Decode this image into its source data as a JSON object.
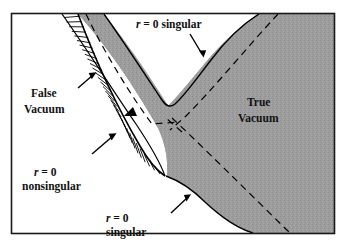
{
  "figure": {
    "frame_color": "#1a1a1a",
    "background_color": "#ffffff",
    "true_vacuum_fill": "#9a9a9a",
    "curve_color": "#000000",
    "dashed_color": "#000000",
    "hatch_color": "#000000"
  },
  "labels": {
    "top_singular": {
      "line1": "r = 0 singular",
      "r_symbol": "r",
      "rest": " = 0 singular"
    },
    "bottom_singular": {
      "line1": "r = 0",
      "line2": "singular"
    },
    "nonsingular": {
      "line1": "r = 0",
      "line2": "nonsingular"
    },
    "false_vacuum": {
      "line1": "False",
      "line2": "Vacuum"
    },
    "true_vacuum": {
      "line1": "True",
      "line2": "Vacuum"
    },
    "r_glyph": "r",
    "eq_zero": " = 0",
    "singular_word": "singular"
  },
  "regions": [
    {
      "name": "false-vacuum-region",
      "label": "False Vacuum"
    },
    {
      "name": "true-vacuum-region",
      "label": "True Vacuum"
    },
    {
      "name": "bubble-wall-band",
      "label": "hatched wall"
    }
  ],
  "annotations": [
    {
      "name": "arrow-top-singular",
      "points_to": "upper singularity curve"
    },
    {
      "name": "arrow-bottom-singular",
      "points_to": "lower singularity curve"
    },
    {
      "name": "arrow-nonsingular",
      "points_to": "bubble wall"
    },
    {
      "name": "arrow-false-vacuum",
      "points_to": "bubble wall"
    }
  ]
}
